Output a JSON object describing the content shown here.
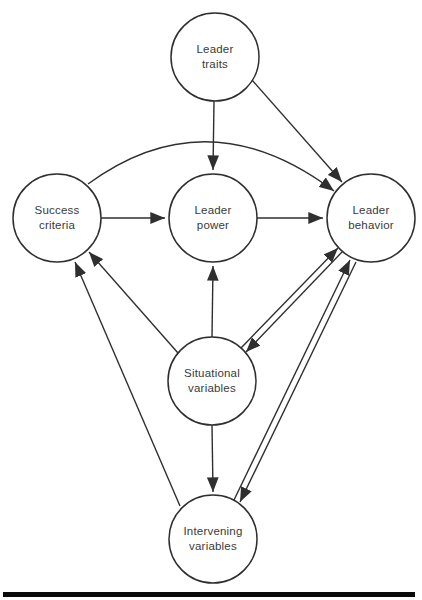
{
  "diagram": {
    "colors": {
      "background": "#ffffff",
      "line": "#2f2f2f",
      "text": "#3a3a3a",
      "bottom_rule": "#0a0a0a"
    },
    "nodes": [
      {
        "id": "leader-traits",
        "label": "Leader\ntraits"
      },
      {
        "id": "success-criteria",
        "label": "Success\ncriteria"
      },
      {
        "id": "leader-power",
        "label": "Leader\npower"
      },
      {
        "id": "leader-behavior",
        "label": "Leader\nbehavior"
      },
      {
        "id": "situational-variables",
        "label": "Situational\nvariables"
      },
      {
        "id": "intervening-variables",
        "label": "Intervening\nvariables"
      }
    ],
    "edges": [
      {
        "from": "leader-traits",
        "to": "leader-power"
      },
      {
        "from": "leader-traits",
        "to": "leader-behavior"
      },
      {
        "from": "success-criteria",
        "to": "leader-power"
      },
      {
        "from": "success-criteria",
        "to": "leader-behavior",
        "style": "curved-over-leader-power"
      },
      {
        "from": "leader-power",
        "to": "leader-behavior"
      },
      {
        "from": "situational-variables",
        "to": "leader-power"
      },
      {
        "from": "situational-variables",
        "to": "success-criteria"
      },
      {
        "from": "situational-variables",
        "to": "leader-behavior"
      },
      {
        "from": "leader-behavior",
        "to": "situational-variables"
      },
      {
        "from": "situational-variables",
        "to": "intervening-variables"
      },
      {
        "from": "intervening-variables",
        "to": "success-criteria"
      },
      {
        "from": "intervening-variables",
        "to": "leader-behavior"
      },
      {
        "from": "leader-behavior",
        "to": "intervening-variables"
      }
    ]
  }
}
